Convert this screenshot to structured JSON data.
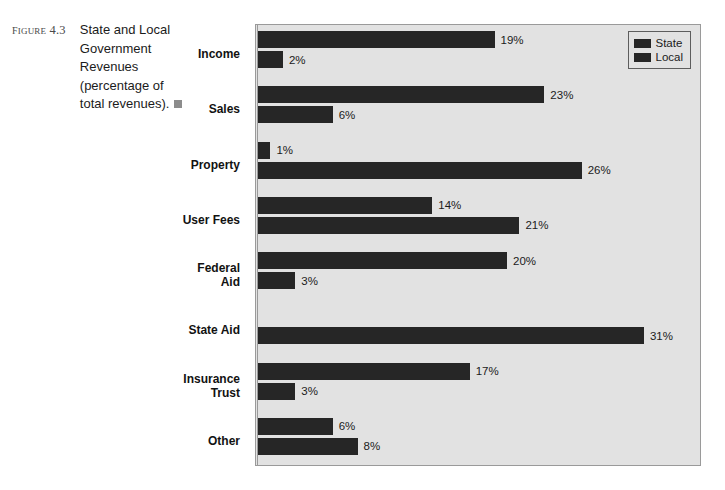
{
  "figure": {
    "number_label": "Figure 4.3",
    "caption": "State and Local Government Revenues (percentage of total revenues).",
    "endmark": "filled-square"
  },
  "legend": {
    "position": "top-right",
    "entries": [
      {
        "label": "State",
        "color": "#262626"
      },
      {
        "label": "Local",
        "color": "#262626"
      }
    ]
  },
  "chart_data": {
    "type": "bar",
    "orientation": "horizontal",
    "title": "State and Local Government Revenues (percentage of total revenues).",
    "xlabel": "",
    "ylabel": "",
    "grid": false,
    "legend_position": "top-right",
    "value_suffix": "%",
    "xlim": [
      0,
      35
    ],
    "categories": [
      "Income",
      "Sales",
      "Property",
      "User Fees",
      "Federal Aid",
      "State Aid",
      "Insurance Trust",
      "Other"
    ],
    "series": [
      {
        "name": "State",
        "color": "#262626",
        "values": [
          19,
          23,
          1,
          14,
          20,
          null,
          17,
          6
        ],
        "labels": [
          "19%",
          "23%",
          "1%",
          "14%",
          "20%",
          "",
          "17%",
          "6%"
        ]
      },
      {
        "name": "Local",
        "color": "#262626",
        "values": [
          2,
          6,
          26,
          21,
          3,
          31,
          3,
          8
        ],
        "labels": [
          "2%",
          "6%",
          "26%",
          "21%",
          "3%",
          "31%",
          "3%",
          "8%"
        ]
      }
    ]
  },
  "style": {
    "plot_background": "#e2e2e2",
    "plot_border": "#9a9a9a",
    "bar_color": "#262626",
    "text_color": "#1b1b1b",
    "figure_number_color": "#4a4a4a",
    "endmark_color": "#8c8c8c"
  }
}
